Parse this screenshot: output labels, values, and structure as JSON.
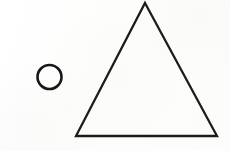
{
  "canvas": {
    "width": 230,
    "height": 151,
    "background_color": "#fdfdfc",
    "ink_color": "#1a1a1a"
  },
  "shapes": [
    {
      "name": "circle",
      "label": "circle",
      "cx": 49.5,
      "cy": 77,
      "r": 12,
      "stroke_color": "#171717",
      "stroke_width": 2.6,
      "fill": "none"
    },
    {
      "name": "triangle",
      "label": "triangle",
      "points": "145,3 217,136 76,136",
      "apex_x": 145,
      "apex_y": 3,
      "bottom_left_x": 76,
      "bottom_left_y": 136,
      "bottom_right_x": 217,
      "bottom_right_y": 136,
      "stroke_color": "#1c1c1c",
      "stroke_width": 2.3,
      "fill": "none"
    }
  ]
}
